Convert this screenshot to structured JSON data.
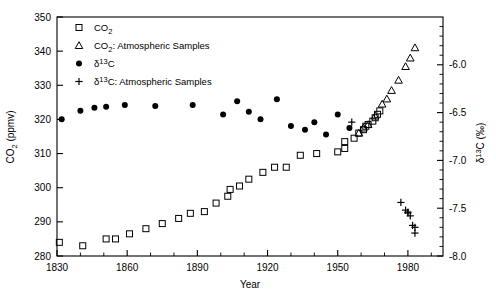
{
  "chart_data": {
    "type": "scatter",
    "title": "",
    "xlabel": "Year",
    "ylabel": "CO2 (ppmv)",
    "ylabel_right": "d13C (permil)",
    "xlim": [
      1830,
      1995
    ],
    "ylim": [
      280,
      350
    ],
    "ylim_right": [
      -8.0,
      -5.5
    ],
    "grid": false,
    "legend_position": "top-left",
    "x_ticks_major": [
      1830,
      1860,
      1890,
      1920,
      1950,
      1980
    ],
    "x_ticks_minor": [
      1840,
      1850,
      1870,
      1880,
      1900,
      1910,
      1930,
      1940,
      1960,
      1970,
      1990
    ],
    "y_ticks_major": [
      280,
      290,
      300,
      310,
      320,
      330,
      340,
      350
    ],
    "y_right_ticks_major": [
      -8.0,
      -7.5,
      -7.0,
      -6.5,
      -6.0
    ],
    "y_right_ticks_minor": [
      -7.9,
      -7.8,
      -7.7,
      -7.6,
      -7.4,
      -7.3,
      -7.2,
      -7.1,
      -6.9,
      -6.8,
      -6.7,
      -6.6,
      -6.4,
      -6.3,
      -6.2,
      -6.1,
      -5.9,
      -5.8,
      -5.7,
      -5.6
    ],
    "series": [
      {
        "name": "CO2",
        "marker": "open-square",
        "axis": "left",
        "unit": "ppmv",
        "points": [
          [
            1831,
            284.0
          ],
          [
            1841,
            283.0
          ],
          [
            1851,
            285.0
          ],
          [
            1855,
            285.0
          ],
          [
            1861,
            286.5
          ],
          [
            1868,
            288.0
          ],
          [
            1875,
            289.5
          ],
          [
            1882,
            291.0
          ],
          [
            1887,
            292.5
          ],
          [
            1893,
            293.0
          ],
          [
            1898,
            295.5
          ],
          [
            1903,
            297.5
          ],
          [
            1904,
            299.5
          ],
          [
            1908,
            300.5
          ],
          [
            1912,
            302.5
          ],
          [
            1918,
            304.5
          ],
          [
            1923,
            306.0
          ],
          [
            1928,
            306.0
          ],
          [
            1934,
            309.5
          ],
          [
            1941,
            310.0
          ],
          [
            1950,
            310.5
          ],
          [
            1953,
            311.5
          ],
          [
            1953,
            313.5
          ],
          [
            1957,
            314.5
          ],
          [
            1959,
            316.0
          ],
          [
            1961,
            317.0
          ],
          [
            1962,
            318.0
          ],
          [
            1963,
            318.5
          ],
          [
            1965,
            319.5
          ],
          [
            1966,
            320.5
          ],
          [
            1967,
            321.5
          ],
          [
            1968,
            322.5
          ]
        ]
      },
      {
        "name": "CO2: Atmospheric Samples",
        "marker": "open-triangle",
        "axis": "left",
        "unit": "ppmv",
        "points": [
          [
            1959,
            316.0
          ],
          [
            1961,
            317.5
          ],
          [
            1963,
            318.5
          ],
          [
            1966,
            321.0
          ],
          [
            1969,
            324.5
          ],
          [
            1971,
            326.0
          ],
          [
            1973,
            328.5
          ],
          [
            1976,
            331.5
          ],
          [
            1979,
            335.5
          ],
          [
            1981,
            338.0
          ],
          [
            1983,
            341.0
          ]
        ]
      },
      {
        "name": "d13C",
        "marker": "filled-circle",
        "axis": "right",
        "unit": "permil",
        "points": [
          [
            1832,
            -6.57
          ],
          [
            1840,
            -6.48
          ],
          [
            1846,
            -6.45
          ],
          [
            1851,
            -6.44
          ],
          [
            1859,
            -6.42
          ],
          [
            1872,
            -6.43
          ],
          [
            1888,
            -6.42
          ],
          [
            1901,
            -6.52
          ],
          [
            1907,
            -6.38
          ],
          [
            1912,
            -6.49
          ],
          [
            1917,
            -6.57
          ],
          [
            1924,
            -6.36
          ],
          [
            1930,
            -6.64
          ],
          [
            1936,
            -6.68
          ],
          [
            1940,
            -6.6
          ],
          [
            1945,
            -6.73
          ],
          [
            1950,
            -6.52
          ],
          [
            1955,
            -6.66
          ]
        ]
      },
      {
        "name": "d13C: Atmospheric Samples",
        "marker": "plus",
        "axis": "right",
        "unit": "permil",
        "points": [
          [
            1956,
            -6.6
          ],
          [
            1977,
            -7.44
          ],
          [
            1979,
            -7.52
          ],
          [
            1980,
            -7.54
          ],
          [
            1980,
            -7.55
          ],
          [
            1981,
            -7.58
          ],
          [
            1982,
            -7.68
          ],
          [
            1983,
            -7.7
          ],
          [
            1983,
            -7.76
          ]
        ]
      }
    ]
  },
  "axes": {
    "x_title": "Year",
    "y_left_title_main": "CO",
    "y_left_title_sub": "2",
    "y_left_title_tail": " (ppmv)",
    "y_right_title_delta": "δ",
    "y_right_title_sup": "13",
    "y_right_title_tail": "C (‰)"
  },
  "legend": {
    "entries": [
      {
        "marker": "open-square",
        "label_main": "CO",
        "label_sub": "2",
        "label_tail": ""
      },
      {
        "marker": "open-triangle",
        "label_main": "CO",
        "label_sub": "2",
        "label_tail": ": Atmospheric Samples"
      },
      {
        "marker": "filled-circle",
        "label_main": "δ",
        "label_sup": "13",
        "label_tail": "C"
      },
      {
        "marker": "plus",
        "label_main": "δ",
        "label_sup": "13",
        "label_tail": "C: Atmospheric Samples"
      }
    ]
  }
}
